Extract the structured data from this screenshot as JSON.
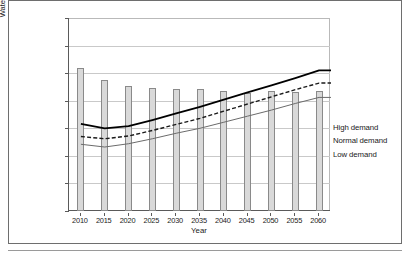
{
  "figure": {
    "y_axis_title": "Water volume (acre-feet)",
    "x_axis_title": "Year"
  },
  "legend": {
    "items": [
      {
        "label": "High demand",
        "style": "solid-thick-black",
        "color": "#000000"
      },
      {
        "label": "Normal demand",
        "style": "dashed-black",
        "color": "#1a1a1a"
      },
      {
        "label": "Low demand",
        "style": "solid-thin-gray",
        "color": "#6b6b6b"
      }
    ]
  },
  "axis": {
    "y_ticks": [
      "50,000",
      "100,000",
      "150,000",
      "200,000",
      "250,000",
      "300,000",
      "350,000",
      "400,000"
    ],
    "x_ticks": [
      "2010",
      "2015",
      "2020",
      "2025",
      "2030",
      "2035",
      "2040",
      "2045",
      "2050",
      "2055",
      "2060"
    ]
  },
  "colors": {
    "bar_fill": "#d9d9d9",
    "bar_stroke": "#8a8a8a",
    "gridline": "#c9c9c9",
    "axis": "#5a5a5a",
    "frame": "#6e6e6e",
    "high_demand": "#000000",
    "normal_demand": "#1a1a1a",
    "low_demand": "#6b6b6b"
  },
  "chart_data": {
    "type": "bar",
    "title": "",
    "subtitle": "",
    "xlabel": "Year",
    "ylabel": "Water volume (acre-feet)",
    "ylim": [
      50000,
      400000
    ],
    "ytick_step": 50000,
    "grid": true,
    "legend_position": "right",
    "categories": [
      "2010",
      "2015",
      "2020",
      "2025",
      "2030",
      "2035",
      "2040",
      "2045",
      "2050",
      "2055",
      "2060"
    ],
    "series": [
      {
        "name": "Water supply",
        "type": "bar",
        "values": [
          310000,
          288000,
          276000,
          273000,
          271000,
          271000,
          268000,
          264000,
          268000,
          266000,
          268000
        ]
      },
      {
        "name": "High demand",
        "type": "line",
        "style": "solid",
        "values": [
          208000,
          200000,
          204000,
          215000,
          227000,
          239000,
          252000,
          265000,
          278000,
          291000,
          305000
        ]
      },
      {
        "name": "Normal demand",
        "type": "line",
        "style": "dashed",
        "values": [
          185000,
          181000,
          186000,
          196000,
          207000,
          218000,
          231000,
          244000,
          257000,
          270000,
          282000
        ]
      },
      {
        "name": "Low demand",
        "type": "line",
        "style": "solid-thin",
        "values": [
          171000,
          166000,
          172000,
          181000,
          191000,
          200000,
          211000,
          222000,
          233000,
          245000,
          256000
        ]
      }
    ]
  }
}
